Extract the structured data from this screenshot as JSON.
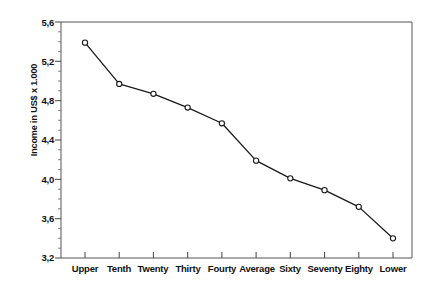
{
  "chart_data": {
    "type": "line",
    "title": "",
    "xlabel": "",
    "ylabel": "Income in US$ x 1.000",
    "categories": [
      "Upper",
      "Tenth",
      "Twenty",
      "Thirty",
      "Fourty",
      "Average",
      "Sixty",
      "Seventy",
      "Eighty",
      "Lower"
    ],
    "values": [
      5.39,
      4.97,
      4.87,
      4.73,
      4.57,
      4.19,
      4.01,
      3.89,
      3.72,
      3.4
    ],
    "series": [
      {
        "name": "Income",
        "values": [
          5.39,
          4.97,
          4.87,
          4.73,
          4.57,
          4.19,
          4.01,
          3.89,
          3.72,
          3.4
        ]
      }
    ],
    "ylim": [
      3.2,
      5.6
    ],
    "ytick_labels": [
      "5,6",
      "5,2",
      "4,8",
      "4,4",
      "4,0",
      "3,6",
      "3,2"
    ],
    "ytick_values": [
      5.6,
      5.2,
      4.8,
      4.4,
      4.0,
      3.6,
      3.2
    ],
    "y_minor_tick_step": 0.1,
    "grid": false,
    "legend": "none",
    "decimal_separator": ",",
    "marker": "open-circle",
    "line_color": "#1a1a1a",
    "marker_fill": "#ffffff",
    "axis_color": "#4a4a4a",
    "background_color": "#ffffff"
  }
}
